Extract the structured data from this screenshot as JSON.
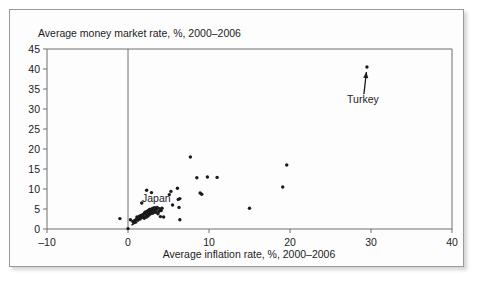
{
  "chart_data": {
    "type": "scatter",
    "title": "",
    "xlabel": "Average inflation rate, %, 2000–2006",
    "ylabel": "Average money market rate, %, 2000–2006",
    "xlim": [
      -10,
      40
    ],
    "ylim": [
      0,
      45
    ],
    "xticks": [
      -10,
      0,
      10,
      20,
      30,
      40
    ],
    "yticks": [
      0,
      5,
      10,
      15,
      20,
      25,
      30,
      35,
      40,
      45
    ],
    "xtick_labels": [
      "–10",
      "0",
      "10",
      "20",
      "30",
      "40"
    ],
    "ytick_labels": [
      "0",
      "5",
      "10",
      "15",
      "20",
      "25",
      "30",
      "35",
      "40",
      "45"
    ],
    "grid": false,
    "legend": false,
    "zero_line_x": 0,
    "series": [
      {
        "name": "Countries",
        "marker": "dot",
        "color": "#1a1a1a",
        "points": [
          [
            -1.0,
            2.6
          ],
          [
            0.0,
            0.1
          ],
          [
            0.3,
            2.3
          ],
          [
            0.6,
            1.9
          ],
          [
            0.8,
            2.1
          ],
          [
            1.0,
            2.4
          ],
          [
            1.1,
            3.0
          ],
          [
            1.2,
            2.2
          ],
          [
            1.3,
            2.8
          ],
          [
            1.4,
            3.2
          ],
          [
            1.5,
            2.5
          ],
          [
            1.6,
            3.4
          ],
          [
            1.7,
            2.9
          ],
          [
            1.8,
            3.6
          ],
          [
            1.9,
            3.1
          ],
          [
            2.0,
            3.9
          ],
          [
            2.0,
            2.7
          ],
          [
            2.1,
            4.2
          ],
          [
            2.2,
            3.5
          ],
          [
            2.3,
            4.4
          ],
          [
            2.3,
            3.0
          ],
          [
            2.4,
            4.0
          ],
          [
            2.5,
            4.6
          ],
          [
            2.5,
            3.3
          ],
          [
            2.6,
            4.1
          ],
          [
            2.7,
            4.8
          ],
          [
            2.7,
            3.7
          ],
          [
            2.8,
            4.3
          ],
          [
            2.9,
            5.0
          ],
          [
            2.9,
            3.9
          ],
          [
            3.0,
            4.5
          ],
          [
            3.1,
            5.2
          ],
          [
            3.1,
            4.0
          ],
          [
            3.2,
            4.7
          ],
          [
            3.3,
            5.3
          ],
          [
            3.4,
            4.2
          ],
          [
            3.5,
            4.9
          ],
          [
            3.6,
            5.4
          ],
          [
            3.7,
            3.8
          ],
          [
            3.8,
            4.4
          ],
          [
            3.9,
            5.1
          ],
          [
            4.0,
            3.1
          ],
          [
            4.1,
            4.6
          ],
          [
            4.2,
            5.2
          ],
          [
            4.4,
            3.0
          ],
          [
            1.7,
            6.5
          ],
          [
            2.3,
            9.7
          ],
          [
            2.9,
            9.1
          ],
          [
            5.1,
            8.6
          ],
          [
            5.3,
            9.4
          ],
          [
            5.5,
            6.0
          ],
          [
            6.1,
            10.2
          ],
          [
            6.2,
            7.4
          ],
          [
            6.4,
            7.6
          ],
          [
            6.3,
            5.4
          ],
          [
            6.4,
            2.3
          ],
          [
            7.7,
            18.0
          ],
          [
            8.5,
            12.8
          ],
          [
            8.9,
            9.0
          ],
          [
            9.1,
            8.7
          ],
          [
            9.8,
            13.0
          ],
          [
            11.0,
            12.9
          ],
          [
            15.0,
            5.2
          ],
          [
            19.1,
            10.5
          ],
          [
            19.6,
            16.0
          ],
          [
            29.5,
            40.5
          ]
        ]
      }
    ],
    "annotations": [
      {
        "label": "Turkey",
        "label_x": 29.0,
        "label_y": 31.5,
        "point_x": 29.5,
        "point_y": 40.5
      },
      {
        "label": "Japan",
        "label_x": 3.5,
        "label_y": 6.8,
        "point_x": 0.0,
        "point_y": 0.1
      }
    ]
  },
  "colors": {
    "marker": "#1a1a1a",
    "axis": "#6f6f6f",
    "text": "#1c1c1c",
    "frame_border": "#9a9a9a",
    "background": "#fdfdfd"
  }
}
